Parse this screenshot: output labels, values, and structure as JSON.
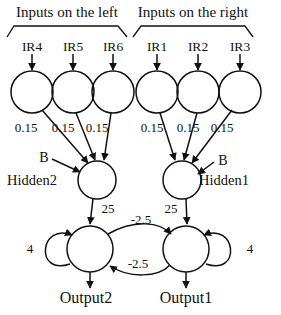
{
  "diagram": {
    "type": "neural-network",
    "title_left": "Inputs on the left",
    "title_right": "Inputs on the right",
    "colors": {
      "stroke": "#111111",
      "background": "#ffffff",
      "text": "#111111"
    },
    "input_groups": [
      {
        "name": "left",
        "title": "Inputs on the left",
        "inputs": [
          {
            "label": "IR4",
            "weight": "0.15"
          },
          {
            "label": "IR5",
            "weight": "0.15"
          },
          {
            "label": "IR6",
            "weight": "0.15"
          }
        ],
        "hidden": {
          "label": "Hidden2",
          "bias": "B"
        }
      },
      {
        "name": "right",
        "title": "Inputs on the right",
        "inputs": [
          {
            "label": "IR1",
            "weight": "0.15"
          },
          {
            "label": "IR2",
            "weight": "0.15"
          },
          {
            "label": "IR3",
            "weight": "0.15"
          }
        ],
        "hidden": {
          "label": "Hidden1",
          "bias": "B"
        }
      }
    ],
    "hidden_to_output": [
      {
        "from": "Hidden2",
        "to": "Output2",
        "weight": "25"
      },
      {
        "from": "Hidden1",
        "to": "Output1",
        "weight": "25"
      }
    ],
    "outputs": [
      {
        "label": "Output2",
        "self_weight": "4"
      },
      {
        "label": "Output1",
        "self_weight": "4"
      }
    ],
    "lateral": [
      {
        "from": "Output2",
        "to": "Output1",
        "weight": "-2.5"
      },
      {
        "from": "Output1",
        "to": "Output2",
        "weight": "-2.5"
      }
    ],
    "labels": {
      "ir4": "IR4",
      "ir5": "IR5",
      "ir6": "IR6",
      "ir1": "IR1",
      "ir2": "IR2",
      "ir3": "IR3",
      "w_left_1": "0.15",
      "w_left_2": "0.15",
      "w_left_3": "0.15",
      "w_right_1": "0.15",
      "w_right_2": "0.15",
      "w_right_3": "0.15",
      "bias_left": "B",
      "bias_right": "B",
      "hidden2": "Hidden2",
      "hidden1": "Hidden1",
      "w_h2_o2": "25",
      "w_h1_o1": "25",
      "w_lat_top": "-2.5",
      "w_lat_bottom": "-2.5",
      "self_left": "4",
      "self_right": "4",
      "output2": "Output2",
      "output1": "Output1"
    }
  }
}
